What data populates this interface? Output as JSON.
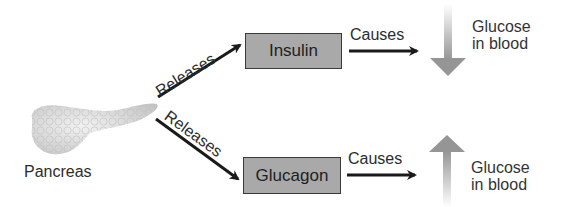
{
  "diagram": {
    "source": {
      "label": "Pancreas"
    },
    "hormones": [
      {
        "name": "Insulin",
        "relation": "Releases",
        "effect_verb": "Causes",
        "effect_label_line1": "Glucose",
        "effect_label_line2": "in blood",
        "effect_direction": "down"
      },
      {
        "name": "Glucagon",
        "relation": "Releases",
        "effect_verb": "Causes",
        "effect_label_line1": "Glucose",
        "effect_label_line2": "in blood",
        "effect_direction": "up"
      }
    ],
    "colors": {
      "box_fill": "#a9a9a9",
      "box_border": "#3a3a3a",
      "arrow": "#1a1a1a",
      "trend_arrow": "#9a9a9a",
      "pancreas": "#d8d8d8"
    }
  }
}
